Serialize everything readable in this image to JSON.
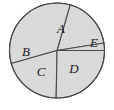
{
  "figure": {
    "type": "pie-sector-diagram",
    "colors": {
      "fill": "#d9d9d9",
      "stroke": "#4a4a4a",
      "label": "#1a1a1a",
      "background": "#ffffff"
    },
    "circle": {
      "center_x": 57,
      "center_y": 50.5,
      "radius": 47.5,
      "stroke_width": 1.1
    },
    "sectors": [
      {
        "label": "A",
        "start_angle_deg": -74,
        "end_angle_deg": -9,
        "label_x": 61,
        "label_y": 30
      },
      {
        "label": "B",
        "start_angle_deg": 164,
        "end_angle_deg": 286,
        "label_x": 26,
        "label_y": 53
      },
      {
        "label": "C",
        "start_angle_deg": 91,
        "end_angle_deg": 164,
        "label_x": 41,
        "label_y": 73
      },
      {
        "label": "D",
        "start_angle_deg": 0,
        "end_angle_deg": 91,
        "label_x": 74,
        "label_y": 70
      },
      {
        "label": "E",
        "start_angle_deg": -9,
        "end_angle_deg": 0,
        "label_x": 94,
        "label_y": 44
      }
    ],
    "labels": [
      "A",
      "B",
      "C",
      "D",
      "E"
    ]
  }
}
